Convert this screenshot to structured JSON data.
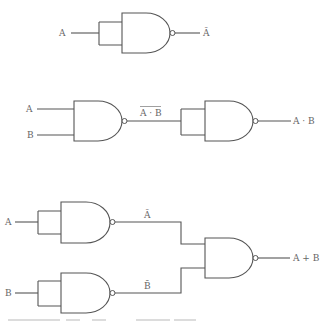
{
  "diagram": {
    "colors": {
      "line": "#555555",
      "text": "#666666",
      "background": "#ffffff"
    },
    "circuits": [
      {
        "name": "not-from-nand",
        "inputs": [
          "A"
        ],
        "output_label": "Ā",
        "output_overline": false
      },
      {
        "name": "and-from-nand",
        "inputs": [
          "A",
          "B"
        ],
        "intermediate_label": "A · B",
        "intermediate_overline": true,
        "output_label": "A · B",
        "output_overline": false
      },
      {
        "name": "or-from-nand",
        "inputs": [
          "A",
          "B"
        ],
        "intermediate_labels": [
          "Ā",
          "B̄"
        ],
        "output_label": "A + B",
        "output_overline": false
      }
    ]
  }
}
